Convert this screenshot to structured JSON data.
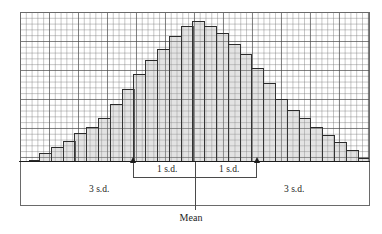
{
  "figure": {
    "name": "normal-curve-histogram"
  },
  "labels": {
    "sd1_left": "1 s.d.",
    "sd1_right": "1 s.d.",
    "sd3_left": "3 s.d.",
    "sd3_right": "3 s.d.",
    "mean": "Mean"
  },
  "colors": {
    "bar_fill": "#aaaaaa",
    "bar_outline": "#2b2b2b",
    "grid_minor": "#6e6e6e",
    "grid_major": "#464646",
    "axis": "#1d1d1d",
    "background": "#ffffff"
  },
  "chart_data": {
    "type": "bar",
    "title": "",
    "xlabel": "",
    "ylabel": "",
    "grid": true,
    "legend": "none",
    "ylim": [
      0,
      150
    ],
    "xlim": [
      0,
      30
    ],
    "annotations": [
      {
        "text": "1 s.d.",
        "from_bar": 9,
        "to_bar": 15,
        "kind": "bracket-arrows"
      },
      {
        "text": "1 s.d.",
        "from_bar": 15,
        "to_bar": 21,
        "kind": "bracket-arrows"
      },
      {
        "text": "3 s.d.",
        "from_bar": 0,
        "to_bar": 15,
        "kind": "bracket"
      },
      {
        "text": "3 s.d.",
        "from_bar": 15,
        "to_bar": 30,
        "kind": "bracket"
      },
      {
        "text": "Mean",
        "at_bar": 15,
        "kind": "center-line"
      }
    ],
    "categories": [
      "1",
      "2",
      "3",
      "4",
      "5",
      "6",
      "7",
      "8",
      "9",
      "10",
      "11",
      "12",
      "13",
      "14",
      "15",
      "16",
      "17",
      "18",
      "19",
      "20",
      "21",
      "22",
      "23",
      "24",
      "25",
      "26",
      "27",
      "28",
      "29",
      "30"
    ],
    "values": [
      1,
      2,
      9,
      15,
      21,
      29,
      35,
      44,
      58,
      73,
      88,
      102,
      113,
      126,
      136,
      141,
      136,
      129,
      118,
      108,
      94,
      79,
      63,
      52,
      44,
      35,
      27,
      20,
      12,
      4
    ]
  }
}
